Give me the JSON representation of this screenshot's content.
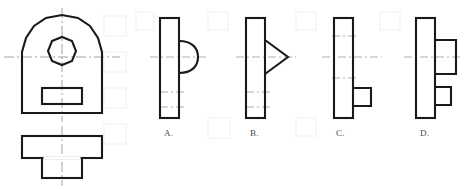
{
  "page": {
    "background_color": "#ffffff",
    "line_color": "#1a1a1a",
    "centerline_color": "#8c8c8c",
    "label_color": "#4a4a4a"
  },
  "given_views": {
    "front_view": {
      "name": "front-view",
      "description": "Arched (dome-top) plate with octagonal through hole and rectangular slot",
      "features": [
        "arched-top-outline",
        "octagonal-hole",
        "rectangular-slot",
        "vertical-centerline",
        "horizontal-centerline"
      ]
    },
    "top_view": {
      "name": "top-view",
      "description": "T-shaped outline: wide rectangle with narrower rectangle projecting below",
      "features": [
        "wide-rectangle",
        "narrow-rectangle",
        "vertical-centerline"
      ]
    }
  },
  "options": [
    {
      "id": "A",
      "label": "A.",
      "name": "option-a",
      "description": "Tall narrow rectangle with semicircular bump on right side at mid height"
    },
    {
      "id": "B",
      "label": "B.",
      "name": "option-b",
      "description": "Tall narrow rectangle with triangular protrusion pointing right at mid height"
    },
    {
      "id": "C",
      "label": "C.",
      "name": "option-c",
      "description": "Tall narrow rectangle with small square protrusion on lower right"
    },
    {
      "id": "D",
      "label": "D.",
      "name": "option-d",
      "description": "Tall narrow rectangle with two rectangular protrusions on the right side"
    }
  ]
}
